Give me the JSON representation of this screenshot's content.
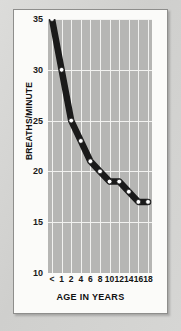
{
  "chart_data": {
    "type": "line",
    "title": "",
    "xlabel": "AGE IN YEARS",
    "ylabel": "BREATHS/MINUTE",
    "x_tick_labels": [
      "<",
      "1",
      "2",
      "4",
      "6",
      "8",
      "10",
      "12",
      "14",
      "16",
      "18"
    ],
    "y_tick_labels": [
      "35",
      "30",
      "25",
      "20",
      "15",
      "10"
    ],
    "y_ticks": [
      35,
      30,
      25,
      20,
      15,
      10
    ],
    "ylim": [
      10,
      35
    ],
    "grid": "both",
    "legend": "none",
    "marker": "white-filled-circle",
    "line_color": "#1a1a1a",
    "marker_face_color": "#ffffff",
    "plot_background": "#b6b6b4",
    "grid_color": "#f2f2f0",
    "categories": [
      "<",
      "1",
      "2",
      "4",
      "6",
      "8",
      "10",
      "12",
      "14",
      "16",
      "18"
    ],
    "values": [
      35,
      30,
      25,
      23,
      21,
      20,
      19,
      19,
      18,
      17,
      17
    ],
    "points": [
      {
        "age": "<",
        "breaths_per_minute": 35
      },
      {
        "age": "1",
        "breaths_per_minute": 30
      },
      {
        "age": "2",
        "breaths_per_minute": 25
      },
      {
        "age": "4",
        "breaths_per_minute": 23
      },
      {
        "age": "6",
        "breaths_per_minute": 21
      },
      {
        "age": "8",
        "breaths_per_minute": 20
      },
      {
        "age": "10",
        "breaths_per_minute": 19
      },
      {
        "age": "12",
        "breaths_per_minute": 19
      },
      {
        "age": "14",
        "breaths_per_minute": 18
      },
      {
        "age": "16",
        "breaths_per_minute": 17
      },
      {
        "age": "18",
        "breaths_per_minute": 17
      }
    ]
  },
  "figure": {
    "card_background": "#fbfbf9",
    "page_background": "#d4d4d2"
  }
}
